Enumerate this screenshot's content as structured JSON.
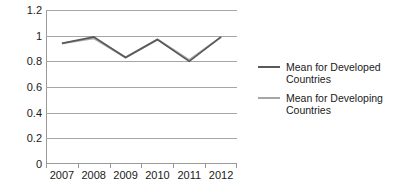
{
  "chart_data": {
    "type": "line",
    "title": "",
    "xlabel": "",
    "ylabel": "",
    "categories": [
      "2007",
      "2008",
      "2009",
      "2010",
      "2011",
      "2012"
    ],
    "ylim": [
      0,
      1.2
    ],
    "yticks": [
      "0",
      "0.2",
      "0.4",
      "0.6",
      "0.8",
      "1",
      "1.2"
    ],
    "ytick_values": [
      0,
      0.2,
      0.4,
      0.6,
      0.8,
      1.0,
      1.2
    ],
    "grid": true,
    "legend_position": "right",
    "series": [
      {
        "name": "Mean for Developed Countries",
        "color": "#595959",
        "values": [
          0.94,
          0.99,
          0.83,
          0.97,
          0.8,
          0.99
        ]
      },
      {
        "name": "Mean for Developing Countries",
        "color": "#a6a6a6",
        "values": [
          0.94,
          0.98,
          0.83,
          0.97,
          0.81,
          0.99
        ]
      }
    ]
  },
  "legend": {
    "items": [
      {
        "label": "Mean for Developed Countries",
        "color": "#595959"
      },
      {
        "label": "Mean for Developing Countries",
        "color": "#a6a6a6"
      }
    ]
  },
  "axes": {
    "y_labels": [
      "1.2",
      "1",
      "0.8",
      "0.6",
      "0.4",
      "0.2",
      "0"
    ],
    "x_labels": [
      "2007",
      "2008",
      "2009",
      "2010",
      "2011",
      "2012"
    ]
  },
  "colors": {
    "grid": "#a6a6a6",
    "axis": "#9a9a9a",
    "developed": "#595959",
    "developing": "#a6a6a6",
    "text": "#1a1a1a",
    "background": "#ffffff"
  }
}
